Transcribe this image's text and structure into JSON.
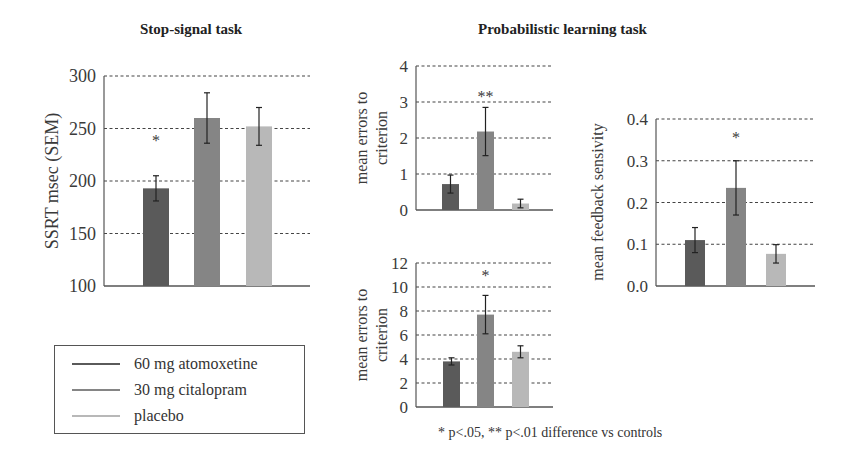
{
  "titles": {
    "stop_signal": "Stop-signal task",
    "probabilistic": "Probabilistic learning task"
  },
  "legend": {
    "items": [
      {
        "label": "60 mg atomoxetine",
        "color": "#5a5a5a"
      },
      {
        "label": "30 mg citalopram",
        "color": "#858585"
      },
      {
        "label": "placebo",
        "color": "#b8b8b8"
      }
    ]
  },
  "footnote": "* p<.05, ** p<.01 difference vs controls",
  "chart_data": [
    {
      "type": "bar",
      "title": "Stop-signal task",
      "ylabel": "SSRT msec (SEM)",
      "ylim": [
        100,
        300
      ],
      "yticks": [
        100,
        150,
        200,
        250,
        300
      ],
      "grid": true,
      "categories": [
        "60 mg atomoxetine",
        "30 mg citalopram",
        "placebo"
      ],
      "values": [
        193,
        260,
        252
      ],
      "errors": [
        12,
        24,
        18
      ],
      "annotations": [
        "*",
        "",
        ""
      ],
      "layout": {
        "x0": 104,
        "x1": 310,
        "ytop": 76,
        "ybot": 286,
        "bars_x": [
          143,
          194,
          246
        ],
        "bar_w": 26
      }
    },
    {
      "type": "bar",
      "title": "Probabilistic learning task",
      "ylabel": "mean errors to criterion",
      "ylim": [
        0,
        4
      ],
      "yticks": [
        0,
        1,
        2,
        3,
        4
      ],
      "grid": true,
      "categories": [
        "60 mg atomoxetine",
        "30 mg citalopram",
        "placebo"
      ],
      "values": [
        0.72,
        2.18,
        0.18
      ],
      "errors": [
        0.25,
        0.67,
        0.12
      ],
      "annotations": [
        "",
        "**",
        ""
      ],
      "layout": {
        "x0": 416,
        "x1": 553,
        "ytop": 66,
        "ybot": 210,
        "bars_x": [
          442,
          477,
          512
        ],
        "bar_w": 17
      }
    },
    {
      "type": "bar",
      "title": "Probabilistic learning task",
      "ylabel": "mean errors to criterion",
      "ylim": [
        0,
        12
      ],
      "yticks": [
        0,
        2,
        4,
        6,
        8,
        10,
        12
      ],
      "grid": true,
      "categories": [
        "60 mg atomoxetine",
        "30 mg citalopram",
        "placebo"
      ],
      "values": [
        3.8,
        7.7,
        4.6
      ],
      "errors": [
        0.3,
        1.6,
        0.5
      ],
      "annotations": [
        "",
        "*",
        ""
      ],
      "layout": {
        "x0": 416,
        "x1": 553,
        "ytop": 263,
        "ybot": 407,
        "bars_x": [
          443,
          477,
          512
        ],
        "bar_w": 17
      }
    },
    {
      "type": "bar",
      "title": "Probabilistic learning task",
      "ylabel": "mean feedback sensivity",
      "ylim": [
        0.0,
        0.4
      ],
      "yticks": [
        "0.0",
        "0.1",
        "0.2",
        "0.3",
        "0.4"
      ],
      "grid": true,
      "categories": [
        "60 mg atomoxetine",
        "30 mg citalopram",
        "placebo"
      ],
      "values": [
        0.11,
        0.235,
        0.077
      ],
      "errors": [
        0.03,
        0.065,
        0.022
      ],
      "annotations": [
        "",
        "*",
        ""
      ],
      "layout": {
        "x0": 656,
        "x1": 815,
        "ytop": 119,
        "ybot": 286,
        "bars_x": [
          685,
          726,
          766
        ],
        "bar_w": 20
      }
    }
  ]
}
